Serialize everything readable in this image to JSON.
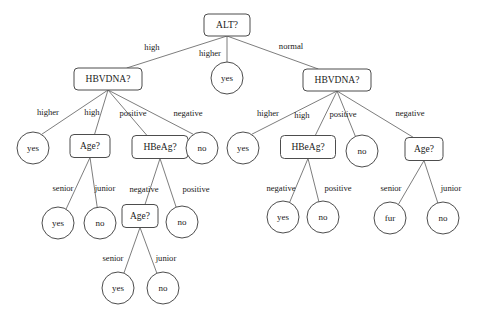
{
  "diagram": {
    "type": "decision-tree",
    "title": "",
    "colors": {
      "background": "#ffffff",
      "node_stroke": "#4d4d4d",
      "node_fill": "#ffffff",
      "edge_stroke": "#6e6e6e",
      "text": "#1a1a1a"
    },
    "root_id": "n_alt",
    "nodes": [
      {
        "id": "n_alt",
        "label": "ALT?",
        "shape": "rounded-rect",
        "x": 227,
        "y": 25,
        "w": 46,
        "h": 22
      },
      {
        "id": "n_hbv_left",
        "label": "HBVDNA?",
        "shape": "rounded-rect",
        "x": 108,
        "y": 79,
        "w": 68,
        "h": 22
      },
      {
        "id": "n_yes_root",
        "label": "yes",
        "shape": "circle",
        "x": 227,
        "y": 78,
        "r": 16
      },
      {
        "id": "n_hbv_right",
        "label": "HBVDNA?",
        "shape": "rounded-rect",
        "x": 337,
        "y": 80,
        "w": 68,
        "h": 22
      },
      {
        "id": "n_l_yes1",
        "label": "yes",
        "shape": "circle",
        "x": 33,
        "y": 148,
        "r": 16
      },
      {
        "id": "n_l_age1",
        "label": "Age?",
        "shape": "rounded-rect",
        "x": 90,
        "y": 146,
        "w": 40,
        "h": 23
      },
      {
        "id": "n_l_hbeag",
        "label": "HBeAg?",
        "shape": "rounded-rect",
        "x": 160,
        "y": 147,
        "w": 56,
        "h": 23
      },
      {
        "id": "n_l_no1",
        "label": "no",
        "shape": "circle",
        "x": 202,
        "y": 148,
        "r": 16
      },
      {
        "id": "n_r_yes1",
        "label": "yes",
        "shape": "circle",
        "x": 243,
        "y": 148,
        "r": 16
      },
      {
        "id": "n_r_hbeag",
        "label": "HBeAg?",
        "shape": "rounded-rect",
        "x": 308,
        "y": 147,
        "w": 55,
        "h": 23
      },
      {
        "id": "n_r_no1",
        "label": "no",
        "shape": "circle",
        "x": 362,
        "y": 151,
        "r": 16
      },
      {
        "id": "n_r_age",
        "label": "Age?",
        "shape": "rounded-rect",
        "x": 424,
        "y": 149,
        "w": 38,
        "h": 23
      },
      {
        "id": "n_l_yes2",
        "label": "yes",
        "shape": "circle",
        "x": 58,
        "y": 223,
        "r": 16
      },
      {
        "id": "n_l_no2",
        "label": "no",
        "shape": "circle",
        "x": 100,
        "y": 223,
        "r": 16
      },
      {
        "id": "n_l_age2",
        "label": "Age?",
        "shape": "rounded-rect",
        "x": 140,
        "y": 216,
        "w": 36,
        "h": 23
      },
      {
        "id": "n_l_no3",
        "label": "no",
        "shape": "circle",
        "x": 182,
        "y": 222,
        "r": 16
      },
      {
        "id": "n_r_yes2",
        "label": "yes",
        "shape": "circle",
        "x": 283,
        "y": 217,
        "r": 16
      },
      {
        "id": "n_r_no2",
        "label": "no",
        "shape": "circle",
        "x": 323,
        "y": 217,
        "r": 16
      },
      {
        "id": "n_r_fur",
        "label": "fur",
        "shape": "circle",
        "x": 390,
        "y": 218,
        "r": 16
      },
      {
        "id": "n_r_no3",
        "label": "no",
        "shape": "circle",
        "x": 443,
        "y": 218,
        "r": 16
      },
      {
        "id": "n_l_yes3",
        "label": "yes",
        "shape": "circle",
        "x": 118,
        "y": 288,
        "r": 16
      },
      {
        "id": "n_l_no4",
        "label": "no",
        "shape": "circle",
        "x": 163,
        "y": 288,
        "r": 16
      }
    ],
    "edges": [
      {
        "from": "n_alt",
        "to": "n_hbv_left",
        "label": "high",
        "lx": 152,
        "ly": 48
      },
      {
        "from": "n_alt",
        "to": "n_yes_root",
        "label": "higher",
        "lx": 210,
        "ly": 54
      },
      {
        "from": "n_alt",
        "to": "n_hbv_right",
        "label": "normal",
        "lx": 291,
        "ly": 47
      },
      {
        "from": "n_hbv_left",
        "to": "n_l_yes1",
        "label": "higher",
        "lx": 48,
        "ly": 113
      },
      {
        "from": "n_hbv_left",
        "to": "n_l_age1",
        "label": "high",
        "lx": 92,
        "ly": 113
      },
      {
        "from": "n_hbv_left",
        "to": "n_l_hbeag",
        "label": "positive",
        "lx": 133,
        "ly": 114
      },
      {
        "from": "n_hbv_left",
        "to": "n_l_no1",
        "label": "negative",
        "lx": 188,
        "ly": 114
      },
      {
        "from": "n_hbv_right",
        "to": "n_r_yes1",
        "label": "higher",
        "lx": 268,
        "ly": 114
      },
      {
        "from": "n_hbv_right",
        "to": "n_r_hbeag",
        "label": "high",
        "lx": 302,
        "ly": 116
      },
      {
        "from": "n_hbv_right",
        "to": "n_r_no1",
        "label": "positive",
        "lx": 343,
        "ly": 115
      },
      {
        "from": "n_hbv_right",
        "to": "n_r_age",
        "label": "negative",
        "lx": 410,
        "ly": 114
      },
      {
        "from": "n_l_age1",
        "to": "n_l_yes2",
        "label": "senior",
        "lx": 63,
        "ly": 189
      },
      {
        "from": "n_l_age1",
        "to": "n_l_no2",
        "label": "junior",
        "lx": 105,
        "ly": 189
      },
      {
        "from": "n_l_hbeag",
        "to": "n_l_age2",
        "label": "negative",
        "lx": 144,
        "ly": 190
      },
      {
        "from": "n_l_hbeag",
        "to": "n_l_no3",
        "label": "positive",
        "lx": 196,
        "ly": 190
      },
      {
        "from": "n_r_hbeag",
        "to": "n_r_yes2",
        "label": "negative",
        "lx": 281,
        "ly": 189
      },
      {
        "from": "n_r_hbeag",
        "to": "n_r_no2",
        "label": "positive",
        "lx": 338,
        "ly": 189
      },
      {
        "from": "n_r_age",
        "to": "n_r_fur",
        "label": "senior",
        "lx": 391,
        "ly": 189
      },
      {
        "from": "n_r_age",
        "to": "n_r_no3",
        "label": "junior",
        "lx": 451,
        "ly": 189
      },
      {
        "from": "n_l_age2",
        "to": "n_l_yes3",
        "label": "senior",
        "lx": 113,
        "ly": 259
      },
      {
        "from": "n_l_age2",
        "to": "n_l_no4",
        "label": "junior",
        "lx": 166,
        "ly": 259
      }
    ]
  }
}
